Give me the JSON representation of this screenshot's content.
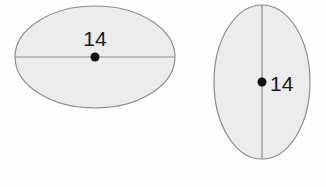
{
  "figure": {
    "background_color": "#fefefe",
    "canvas": {
      "width": 326,
      "height": 187
    },
    "shapes": [
      {
        "id": "left-ellipse",
        "name": "horizontal-ellipse",
        "orientation": "horizontal",
        "center": {
          "x": 95,
          "y": 57
        },
        "radius_x": 80,
        "radius_y": 51,
        "fill_color": "#ececec",
        "stroke_color": "#8c8c8c",
        "stroke_width": 1.2,
        "axis": {
          "name": "major-axis",
          "orientation": "horizontal",
          "from": {
            "x": 15,
            "y": 57
          },
          "to": {
            "x": 175,
            "y": 57
          },
          "color": "#8c8c8c",
          "width": 1.2
        },
        "center_dot": {
          "x": 95,
          "y": 57,
          "radius": 4.5,
          "color": "#111111"
        },
        "label": {
          "text": "14",
          "x": 95,
          "y": 46,
          "anchor": "middle",
          "color": "#1a1a1a"
        }
      },
      {
        "id": "right-ellipse",
        "name": "vertical-ellipse",
        "orientation": "vertical",
        "center": {
          "x": 262,
          "y": 82
        },
        "radius_x": 48,
        "radius_y": 77,
        "fill_color": "#ececec",
        "stroke_color": "#8c8c8c",
        "stroke_width": 1.2,
        "axis": {
          "name": "major-axis",
          "orientation": "vertical",
          "from": {
            "x": 262,
            "y": 5
          },
          "to": {
            "x": 262,
            "y": 159
          },
          "color": "#8c8c8c",
          "width": 1.2
        },
        "center_dot": {
          "x": 262,
          "y": 82,
          "radius": 4.5,
          "color": "#111111"
        },
        "label": {
          "text": "14",
          "x": 270,
          "y": 91,
          "anchor": "start",
          "color": "#1a1a1a"
        }
      }
    ]
  }
}
